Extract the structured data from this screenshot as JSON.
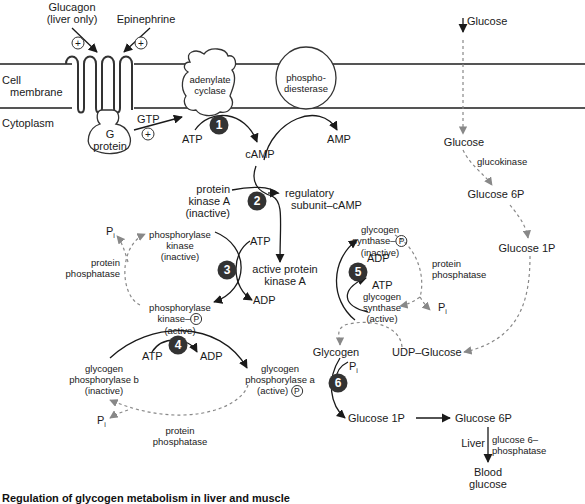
{
  "diagram": {
    "title": "Regulation of glycogen metabolism",
    "regions": {
      "membrane": "Cell\nmembrane",
      "membrane_line1": "Cell",
      "membrane_line2": "membrane",
      "cytoplasm": "Cytoplasm"
    },
    "signals": {
      "glucagon_line1": "Glucagon",
      "glucagon_line2": "(liver only)",
      "epinephrine": "Epinephrine",
      "plus": "+"
    },
    "membrane_proteins": {
      "adenylate_cyclase_line1": "adenylate",
      "adenylate_cyclase_line2": "cyclase",
      "phosphodiesterase_line1": "phospho-",
      "phosphodiesterase_line2": "diesterase",
      "g_protein_line1": "G",
      "g_protein_line2": "protein"
    },
    "molecules": {
      "gtp": "GTP",
      "atp": "ATP",
      "adp": "ADP",
      "camp": "cAMP",
      "amp": "AMP",
      "pi": "P",
      "pi_sub": "i",
      "p_circle": "P"
    },
    "steps": [
      "1",
      "2",
      "3",
      "4",
      "5",
      "6"
    ],
    "enzymes": {
      "pka_inactive_line1": "protein",
      "pka_inactive_line2": "kinase A",
      "pka_inactive_line3": "(inactive)",
      "regulatory_line1": "regulatory",
      "regulatory_line2": "subunit–cAMP",
      "pka_active_line1": "active protein",
      "pka_active_line2": "kinase A",
      "phk_inactive_line1": "phosphorylase",
      "phk_inactive_line2": "kinase",
      "phk_inactive_line3": "(inactive)",
      "phk_active_line1": "phosphorylase",
      "phk_active_line2": "kinase–",
      "phk_active_line3": "(active)",
      "protein_phosphatase_line1": "protein",
      "protein_phosphatase_line2": "phosphatase",
      "gpb_line1": "glycogen",
      "gpb_line2": "phosphorylase b",
      "gpb_line3": "(inactive)",
      "gpa_line1": "glycogen",
      "gpa_line2": "phosphorylase a",
      "gpa_line3": "(active)",
      "gs_inactive_line1": "glycogen",
      "gs_inactive_line2": "synthase–",
      "gs_inactive_line3": "(inactive)",
      "gs_active_line1": "glycogen",
      "gs_active_line2": "synthase",
      "gs_active_line3": "(active)",
      "glucokinase": "glucokinase",
      "g6pase_line1": "glucose 6–",
      "g6pase_line2": "phosphatase"
    },
    "metabolites": {
      "glucose_outside": "Glucose",
      "glucose_inside": "Glucose",
      "glucose_6p": "Glucose 6P",
      "glucose_1p": "Glucose 1P",
      "udp_glucose": "UDP–Glucose",
      "glycogen": "Glycogen",
      "glucose_1p_bottom": "Glucose 1P",
      "glucose_6p_bottom": "Glucose 6P",
      "liver": "Liver",
      "blood_glucose_line1": "Blood",
      "blood_glucose_line2": "glucose"
    },
    "caption": "Regulation of glycogen metabolism in liver and muscle"
  },
  "colors": {
    "line": "#1a1a1a",
    "dashed": "#888888",
    "membrane": "#555555",
    "step_badge": "#333333"
  }
}
